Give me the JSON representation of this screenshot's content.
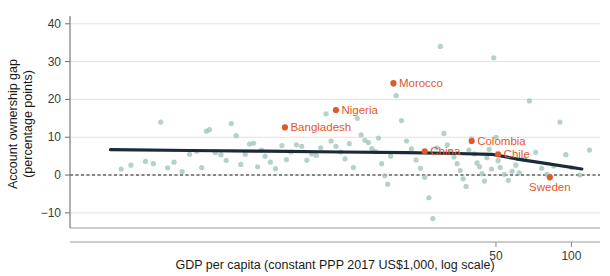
{
  "chart_data": {
    "type": "scatter",
    "title": "",
    "xlabel": "GDP per capita (constant PPP 2017 US$1,000, log scale)",
    "ylabel": "Account ownership gap\n(percentage points)",
    "ylabel_line1": "Account ownership gap",
    "ylabel_line2": "(percentage points)",
    "x_scale": "log",
    "xlim": [
      1.0,
      130.0
    ],
    "ylim": [
      -14,
      41
    ],
    "yticks": [
      40,
      30,
      20,
      10,
      0,
      -10
    ],
    "ytick_labels": [
      "40",
      "30",
      "20",
      "10",
      "0",
      "−10"
    ],
    "xticks": [
      50,
      100
    ],
    "xtick_labels": [
      "50",
      "100"
    ],
    "grid": "horizontal",
    "zero_reference_line": {
      "value": 0,
      "style": "dashed",
      "color": "#1a1a1a"
    },
    "colors": {
      "points": "#9dc2b5",
      "highlight": "#E1582A",
      "trend": "#1b2a3a",
      "grid": "#e2e2e2",
      "axis": "#9a9a9a",
      "text": "#1a1a1a"
    },
    "legend": {
      "show": false
    },
    "series": [
      {
        "name": "Countries",
        "marker": "circle",
        "color": "#9dc2b5",
        "points": [
          {
            "x": 1.6,
            "y": 1.6
          },
          {
            "x": 1.75,
            "y": 2.6
          },
          {
            "x": 2.0,
            "y": 3.6
          },
          {
            "x": 2.15,
            "y": 3.0
          },
          {
            "x": 2.3,
            "y": 14.0
          },
          {
            "x": 2.45,
            "y": 1.9
          },
          {
            "x": 2.6,
            "y": 3.4
          },
          {
            "x": 2.8,
            "y": 0.9
          },
          {
            "x": 3.0,
            "y": 5.5
          },
          {
            "x": 3.2,
            "y": 6.3
          },
          {
            "x": 3.35,
            "y": 2.0
          },
          {
            "x": 3.5,
            "y": 11.6
          },
          {
            "x": 3.6,
            "y": 12.0
          },
          {
            "x": 3.8,
            "y": 5.9
          },
          {
            "x": 4.0,
            "y": 5.4
          },
          {
            "x": 4.2,
            "y": 3.9
          },
          {
            "x": 4.4,
            "y": 13.6
          },
          {
            "x": 4.6,
            "y": 10.4
          },
          {
            "x": 4.8,
            "y": 2.8
          },
          {
            "x": 5.0,
            "y": 5.5
          },
          {
            "x": 5.2,
            "y": 8.2
          },
          {
            "x": 5.4,
            "y": 8.4
          },
          {
            "x": 5.6,
            "y": 2.2
          },
          {
            "x": 5.8,
            "y": 6.6
          },
          {
            "x": 6.0,
            "y": 5.0
          },
          {
            "x": 6.3,
            "y": 3.4
          },
          {
            "x": 6.6,
            "y": 1.7
          },
          {
            "x": 7.0,
            "y": 7.8
          },
          {
            "x": 7.3,
            "y": 4.1
          },
          {
            "x": 7.6,
            "y": 6.1
          },
          {
            "x": 8.0,
            "y": 8.0
          },
          {
            "x": 8.4,
            "y": 7.6
          },
          {
            "x": 8.8,
            "y": 3.9
          },
          {
            "x": 9.2,
            "y": 5.6
          },
          {
            "x": 9.6,
            "y": 5.2
          },
          {
            "x": 10.0,
            "y": 7.2
          },
          {
            "x": 10.5,
            "y": 16.2
          },
          {
            "x": 11.0,
            "y": 9.0
          },
          {
            "x": 11.5,
            "y": 7.6
          },
          {
            "x": 12.0,
            "y": 6.1
          },
          {
            "x": 12.5,
            "y": 4.3
          },
          {
            "x": 13.0,
            "y": 8.3
          },
          {
            "x": 13.5,
            "y": 2.0
          },
          {
            "x": 14.0,
            "y": 15.0
          },
          {
            "x": 14.5,
            "y": 10.6
          },
          {
            "x": 15.0,
            "y": 9.2
          },
          {
            "x": 15.5,
            "y": 8.6
          },
          {
            "x": 16.0,
            "y": 7.0
          },
          {
            "x": 16.5,
            "y": 6.2
          },
          {
            "x": 17.0,
            "y": 9.8
          },
          {
            "x": 17.5,
            "y": 3.0
          },
          {
            "x": 18.0,
            "y": -0.2
          },
          {
            "x": 18.5,
            "y": -2.4
          },
          {
            "x": 19.0,
            "y": 5.0
          },
          {
            "x": 19.5,
            "y": 24.0
          },
          {
            "x": 20.0,
            "y": 21.0
          },
          {
            "x": 21.0,
            "y": 14.4
          },
          {
            "x": 22.0,
            "y": 9.0
          },
          {
            "x": 23.0,
            "y": 6.9
          },
          {
            "x": 24.0,
            "y": 4.0
          },
          {
            "x": 25.0,
            "y": 1.8
          },
          {
            "x": 26.0,
            "y": -0.6
          },
          {
            "x": 27.0,
            "y": -6.0
          },
          {
            "x": 28.0,
            "y": -11.5
          },
          {
            "x": 29.0,
            "y": 7.2
          },
          {
            "x": 30.0,
            "y": 34.0
          },
          {
            "x": 31.0,
            "y": 11.0
          },
          {
            "x": 32.0,
            "y": 8.0
          },
          {
            "x": 33.0,
            "y": 6.2
          },
          {
            "x": 34.0,
            "y": 4.8
          },
          {
            "x": 35.0,
            "y": 3.0
          },
          {
            "x": 36.0,
            "y": 1.2
          },
          {
            "x": 37.0,
            "y": -1.0
          },
          {
            "x": 38.0,
            "y": -3.0
          },
          {
            "x": 39.0,
            "y": 6.6
          },
          {
            "x": 40.0,
            "y": 9.6
          },
          {
            "x": 41.0,
            "y": 5.6
          },
          {
            "x": 42.0,
            "y": 3.2
          },
          {
            "x": 43.0,
            "y": 2.2
          },
          {
            "x": 44.0,
            "y": 0.4
          },
          {
            "x": 45.0,
            "y": -1.6
          },
          {
            "x": 46.0,
            "y": 4.6
          },
          {
            "x": 47.0,
            "y": 6.8
          },
          {
            "x": 48.0,
            "y": 1.6
          },
          {
            "x": 49.0,
            "y": 31.0
          },
          {
            "x": 50.0,
            "y": 10.0
          },
          {
            "x": 51.0,
            "y": 3.8
          },
          {
            "x": 52.0,
            "y": 2.0
          },
          {
            "x": 54.0,
            "y": 0.2
          },
          {
            "x": 56.0,
            "y": -1.4
          },
          {
            "x": 58.0,
            "y": 1.0
          },
          {
            "x": 60.0,
            "y": 2.6
          },
          {
            "x": 62.0,
            "y": 0.6
          },
          {
            "x": 65.0,
            "y": 4.2
          },
          {
            "x": 68.0,
            "y": 19.6
          },
          {
            "x": 72.0,
            "y": 6.0
          },
          {
            "x": 76.0,
            "y": 1.8
          },
          {
            "x": 80.0,
            "y": 0.2
          },
          {
            "x": 85.0,
            "y": 2.4
          },
          {
            "x": 90.0,
            "y": 14.0
          },
          {
            "x": 95.0,
            "y": 5.4
          },
          {
            "x": 100.0,
            "y": 2.0
          },
          {
            "x": 108.0,
            "y": 0.0
          },
          {
            "x": 118.0,
            "y": 6.6
          }
        ]
      }
    ],
    "highlighted": [
      {
        "label": "Morocco",
        "x": 19.5,
        "y": 24.3,
        "label_side": "right"
      },
      {
        "label": "Nigeria",
        "x": 11.5,
        "y": 17.2,
        "label_side": "right"
      },
      {
        "label": "Bangladesh",
        "x": 7.2,
        "y": 12.6,
        "label_side": "right"
      },
      {
        "label": "Colombia",
        "x": 40.0,
        "y": 9.0,
        "label_side": "right"
      },
      {
        "label": "China",
        "x": 26.0,
        "y": 6.3,
        "label_side": "right"
      },
      {
        "label": "Chile",
        "x": 51.0,
        "y": 5.5,
        "label_side": "right"
      },
      {
        "label": "Sweden",
        "x": 82.0,
        "y": -0.6,
        "label_side": "below"
      }
    ],
    "trend_line": {
      "name": "Smoothed trend",
      "color": "#1b2a3a",
      "points": [
        {
          "x": 1.45,
          "y": 6.7
        },
        {
          "x": 3.0,
          "y": 6.5
        },
        {
          "x": 6.0,
          "y": 6.3
        },
        {
          "x": 12.0,
          "y": 6.1
        },
        {
          "x": 22.0,
          "y": 5.9
        },
        {
          "x": 35.0,
          "y": 5.7
        },
        {
          "x": 48.0,
          "y": 5.5
        },
        {
          "x": 60.0,
          "y": 4.3
        },
        {
          "x": 80.0,
          "y": 3.0
        },
        {
          "x": 110.0,
          "y": 1.6
        }
      ]
    }
  }
}
